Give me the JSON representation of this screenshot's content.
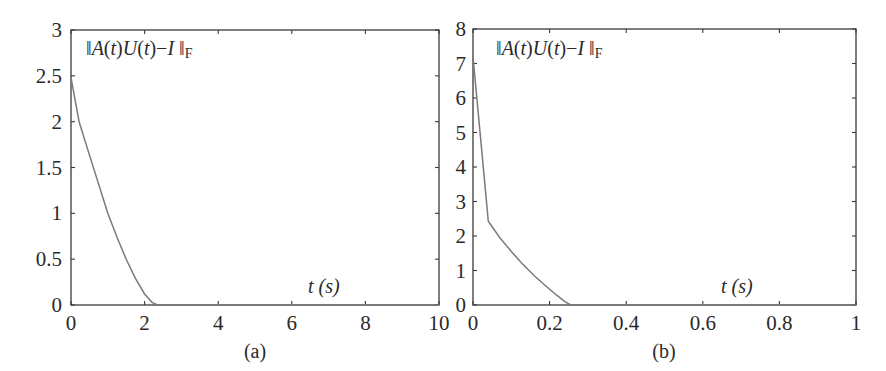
{
  "chart_data": [
    {
      "id": "a",
      "type": "line",
      "caption": "(a)",
      "annotation": "‖A(t)U(t)−I‖F",
      "xlabel": "t (s)",
      "ylabel": "",
      "xlim": [
        0,
        10
      ],
      "ylim": [
        0,
        3
      ],
      "xticks": [
        0,
        2,
        4,
        6,
        8,
        10
      ],
      "xtick_labels": [
        "0",
        "2",
        "4",
        "6",
        "8",
        "10"
      ],
      "yticks": [
        0,
        0.5,
        1,
        1.5,
        2,
        2.5,
        3
      ],
      "ytick_labels": [
        "0",
        "0.5",
        "1",
        "1.5",
        "2",
        "2.5",
        "3"
      ],
      "grid": false,
      "series": [
        {
          "name": "‖A(t)U(t)−I‖F",
          "color": "#7a7a7a",
          "x": [
            0,
            0.22,
            0.46,
            0.75,
            1.0,
            1.25,
            1.5,
            1.75,
            2.0,
            2.2,
            2.35,
            3,
            4,
            5,
            6,
            7,
            8,
            9,
            10
          ],
          "y": [
            2.48,
            2.0,
            1.69,
            1.32,
            1.0,
            0.74,
            0.5,
            0.29,
            0.12,
            0.03,
            0,
            0,
            0,
            0,
            0,
            0,
            0,
            0,
            0
          ]
        }
      ]
    },
    {
      "id": "b",
      "type": "line",
      "caption": "(b)",
      "annotation": "‖A(t)U(t)−I‖F",
      "xlabel": "t (s)",
      "ylabel": "",
      "xlim": [
        0,
        1
      ],
      "ylim": [
        0,
        8
      ],
      "xticks": [
        0,
        0.2,
        0.4,
        0.6,
        0.8,
        1
      ],
      "xtick_labels": [
        "0",
        "0.2",
        "0.4",
        "0.6",
        "0.8",
        "1"
      ],
      "yticks": [
        0,
        1,
        2,
        3,
        4,
        5,
        6,
        7,
        8
      ],
      "ytick_labels": [
        "0",
        "1",
        "2",
        "3",
        "4",
        "5",
        "6",
        "7",
        "8"
      ],
      "grid": false,
      "series": [
        {
          "name": "‖A(t)U(t)−I‖F",
          "color": "#7a7a7a",
          "x": [
            0,
            0.04,
            0.07,
            0.1,
            0.13,
            0.16,
            0.19,
            0.22,
            0.24,
            0.255,
            0.3,
            0.4,
            0.5,
            0.6,
            0.7,
            0.8,
            0.9,
            1.0
          ],
          "y": [
            7.2,
            2.43,
            1.95,
            1.55,
            1.18,
            0.85,
            0.55,
            0.27,
            0.1,
            0,
            0,
            0,
            0,
            0,
            0,
            0,
            0,
            0
          ]
        }
      ]
    }
  ]
}
